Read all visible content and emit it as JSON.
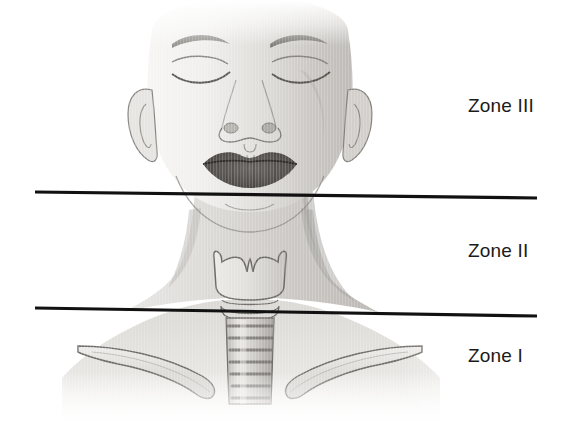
{
  "figure": {
    "background_color": "#ffffff",
    "width": 563,
    "height": 423
  },
  "labels": {
    "zone3": "Zone III",
    "zone2": "Zone II",
    "zone1": "Zone I"
  },
  "divider_lines": [
    {
      "name": "zone-III-II-boundary",
      "x1": 35,
      "y1": 192,
      "x2": 537,
      "y2": 198,
      "color": "#111111",
      "width": 3.2
    },
    {
      "name": "zone-II-I-boundary",
      "x1": 35,
      "y1": 308,
      "x2": 537,
      "y2": 316,
      "color": "#111111",
      "width": 3.2
    }
  ],
  "anatomy": {
    "parts": [
      "head",
      "face",
      "left-eye",
      "right-eye",
      "left-eyebrow",
      "right-eyebrow",
      "nose",
      "lips",
      "left-ear",
      "right-ear",
      "jawline",
      "neck",
      "left-shoulder",
      "right-shoulder",
      "thyroid-cartilage",
      "cricoid-cartilage",
      "trachea",
      "left-clavicle",
      "right-clavicle"
    ],
    "skin_tone_light": "#f2f1ef",
    "skin_tone_mid": "#d8d6d3",
    "skin_tone_shadow": "#b4b1ad",
    "outline_color": "#6f6c68",
    "lips_color": "#55514e"
  }
}
